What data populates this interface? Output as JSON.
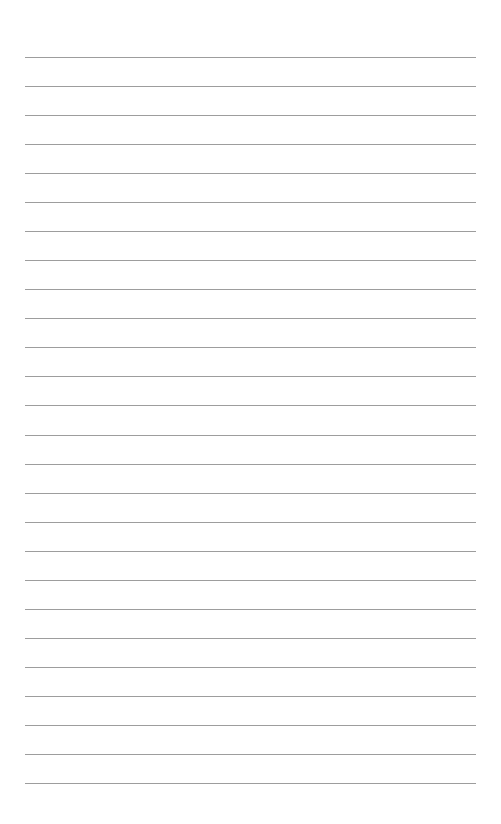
{
  "page": {
    "type": "lined-paper",
    "background_color": "#ffffff",
    "rule_color": "#8c8c8c",
    "rule_count": 26,
    "first_rule_y": 57,
    "rule_spacing": 29.04,
    "rule_left": 25,
    "rule_width": 451
  }
}
